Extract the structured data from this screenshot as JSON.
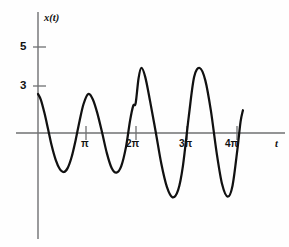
{
  "figure": {
    "background_color": "#fefefe",
    "curve_color": "#111111",
    "axis_color": "#6f7072"
  },
  "axes": {
    "y_label": "x(t)",
    "x_label": "t",
    "y_ticks": [
      {
        "label": "5",
        "value": 5
      },
      {
        "label": "3",
        "value": 3
      }
    ],
    "x_ticks": [
      {
        "label": "π",
        "value": 3.14159
      },
      {
        "label": "2π",
        "value": 6.28319
      },
      {
        "label": "3π",
        "value": 9.42478
      },
      {
        "label": "4π",
        "value": 12.56637
      }
    ]
  },
  "chart_data": {
    "type": "line",
    "title": "",
    "xlabel": "t",
    "ylabel": "x(t)",
    "xlim": [
      0,
      13.6
    ],
    "ylim": [
      -6.6,
      6.4
    ],
    "grid": false,
    "legend": null,
    "axis_origin": [
      0,
      0
    ],
    "series": [
      {
        "name": "x(t)",
        "description": "Growing-amplitude oscillation beginning at x(0)=3, with a small shoulder/kink on the rising edge just before 2π, truncated abruptly just past 4π",
        "x": [
          0.0,
          0.18,
          0.4,
          0.62,
          0.85,
          1.1,
          1.35,
          1.6,
          1.85,
          2.1,
          2.35,
          2.6,
          2.85,
          3.14,
          3.42,
          3.7,
          4.0,
          4.3,
          4.6,
          4.9,
          5.2,
          5.5,
          5.75,
          5.95,
          6.1,
          6.28,
          6.45,
          6.7,
          7.0,
          7.35,
          7.7,
          8.05,
          8.4,
          8.75,
          9.05,
          9.42,
          9.75,
          10.1,
          10.45,
          10.8,
          11.15,
          11.5,
          11.85,
          12.15,
          12.45,
          12.65,
          12.8
        ],
        "y": [
          3.0,
          2.55,
          1.55,
          0.35,
          -0.95,
          -2.05,
          -2.75,
          -3.0,
          -2.7,
          -1.85,
          -0.55,
          0.95,
          2.25,
          3.0,
          2.6,
          1.55,
          0.05,
          -1.55,
          -2.7,
          -3.05,
          -2.55,
          -1.05,
          0.95,
          2.1,
          2.3,
          4.2,
          5.0,
          4.3,
          2.45,
          0.1,
          -2.35,
          -4.15,
          -4.95,
          -4.4,
          -2.55,
          1.3,
          4.3,
          5.0,
          4.05,
          1.7,
          -1.45,
          -3.95,
          -4.9,
          -4.05,
          -1.3,
          0.85,
          1.75
        ]
      }
    ],
    "annotations": [
      {
        "name": "kink",
        "text": "small shoulder on rising edge before 2π",
        "x": 6.05,
        "y": 2.3
      },
      {
        "name": "truncation",
        "text": "curve ends abruptly just after 4π",
        "x": 12.8,
        "y": 1.75
      }
    ]
  }
}
